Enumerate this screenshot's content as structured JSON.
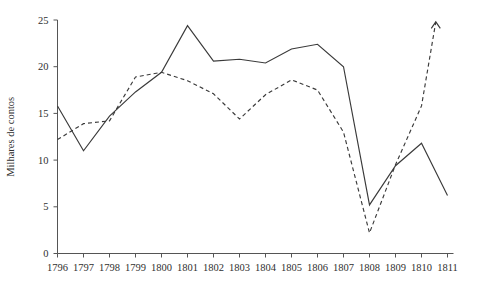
{
  "chart_data": {
    "type": "line",
    "title": "",
    "subtitle": "",
    "xlabel": "",
    "ylabel": "Milhares de contos",
    "xlim": [
      1796,
      1811
    ],
    "ylim": [
      0,
      25
    ],
    "grid": false,
    "legend": "none",
    "y_ticks": [
      0,
      5,
      10,
      15,
      20,
      25
    ],
    "y_tick_labels": [
      "0",
      "5",
      "10",
      "15",
      "20",
      "25"
    ],
    "categories": [
      1796,
      1797,
      1798,
      1799,
      1800,
      1801,
      1802,
      1803,
      1804,
      1805,
      1806,
      1807,
      1808,
      1809,
      1810,
      1811
    ],
    "x_tick_labels": [
      "1796",
      "1797",
      "1798",
      "1799",
      "1800",
      "1801",
      "1802",
      "1803",
      "1804",
      "1805",
      "1806",
      "1807",
      "1808",
      "1809",
      "1810",
      "1811"
    ],
    "series": [
      {
        "name": "solid-series",
        "style": "solid",
        "color": "#3a3a3a",
        "values": [
          15.8,
          11.0,
          14.7,
          17.3,
          19.4,
          24.4,
          20.6,
          20.8,
          20.4,
          21.9,
          22.4,
          20.0,
          5.2,
          9.4,
          11.8,
          6.2
        ]
      },
      {
        "name": "dashed-series",
        "style": "dashed",
        "color": "#3a3a3a",
        "values": [
          12.2,
          13.9,
          14.2,
          18.9,
          19.4,
          18.5,
          17.1,
          14.4,
          17.0,
          18.6,
          17.5,
          13.0,
          2.2,
          9.5,
          15.8,
          null
        ]
      }
    ],
    "annotations": [
      {
        "name": "dashed-series-arrow",
        "type": "arrow-up",
        "x": 1810.55,
        "y": 24.8,
        "note": "dashed series terminates in an upward arrowhead between 1810 and 1811"
      }
    ]
  },
  "axes": {
    "y_axis_name": "y-axis",
    "x_axis_name": "x-axis"
  }
}
